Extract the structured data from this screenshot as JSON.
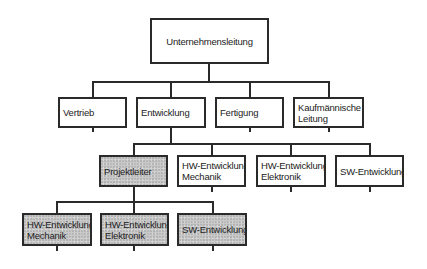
{
  "diagram": {
    "type": "org-chart",
    "root": {
      "label": "Unternehmensleitung"
    },
    "level2": [
      {
        "label": "Vertrieb"
      },
      {
        "label": "Entwicklung"
      },
      {
        "label": "Fertigung"
      },
      {
        "label_line1": "Kaufmännische",
        "label_line2": "Leitung"
      }
    ],
    "level3": [
      {
        "label": "Projektleiter",
        "shaded": true
      },
      {
        "label_line1": "HW-Entwicklung",
        "label_line2": "Mechanik",
        "shaded": false
      },
      {
        "label_line1": "HW-Entwicklung",
        "label_line2": "Elektronik",
        "shaded": false
      },
      {
        "label": "SW-Entwicklung",
        "shaded": false
      }
    ],
    "level4": [
      {
        "label_line1": "HW-Entwicklung",
        "label_line2": "Mechanik",
        "shaded": true
      },
      {
        "label_line1": "HW-Entwicklung",
        "label_line2": "Elektronik",
        "shaded": true
      },
      {
        "label": "SW-Entwicklung",
        "shaded": true
      }
    ],
    "colors": {
      "line": "#2a2a2a",
      "shade": "#c9c9c9",
      "background": "#ffffff"
    }
  }
}
